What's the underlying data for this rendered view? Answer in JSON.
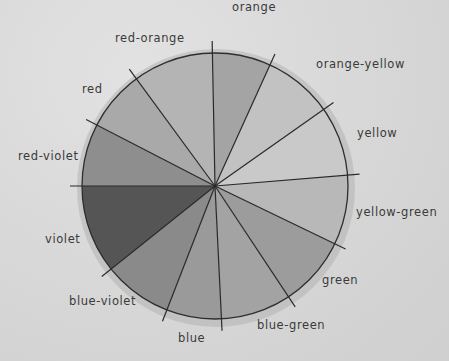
{
  "diagram": {
    "center": [
      215,
      186
    ],
    "radius": 133,
    "segments": [
      {
        "name": "orange",
        "fill": "#a4a4a4",
        "label_pos": [
          232,
          2
        ]
      },
      {
        "name": "orange-yellow",
        "fill": "#c2c2c2",
        "label_pos": [
          316,
          59
        ]
      },
      {
        "name": "yellow",
        "fill": "#c9c9c9",
        "label_pos": [
          357,
          128
        ]
      },
      {
        "name": "yellow-green",
        "fill": "#b8b8b8",
        "label_pos": [
          356,
          207
        ]
      },
      {
        "name": "green",
        "fill": "#9c9c9c",
        "label_pos": [
          322,
          275
        ]
      },
      {
        "name": "blue-green",
        "fill": "#a3a3a3",
        "label_pos": [
          257,
          320
        ]
      },
      {
        "name": "blue",
        "fill": "#9a9a9a",
        "label_pos": [
          178,
          333
        ]
      },
      {
        "name": "blue-violet",
        "fill": "#8a8a8a",
        "label_pos": [
          69,
          296
        ]
      },
      {
        "name": "violet",
        "fill": "#555555",
        "label_pos": [
          45,
          234
        ]
      },
      {
        "name": "red-violet",
        "fill": "#8e8e8e",
        "label_pos": [
          18,
          151
        ]
      },
      {
        "name": "red",
        "fill": "#a9a9a9",
        "label_pos": [
          82,
          84
        ]
      },
      {
        "name": "red-orange",
        "fill": "#b4b4b4",
        "label_pos": [
          115,
          33
        ]
      }
    ],
    "spokes": [
      [
        212,
        33
      ],
      [
        279,
        45
      ],
      [
        327,
        107
      ],
      [
        362,
        174
      ],
      [
        333,
        243
      ],
      [
        292,
        302
      ],
      [
        222,
        330
      ],
      [
        161,
        325
      ],
      [
        110,
        270
      ],
      [
        80,
        186
      ],
      [
        87,
        120
      ],
      [
        130,
        70
      ]
    ]
  }
}
